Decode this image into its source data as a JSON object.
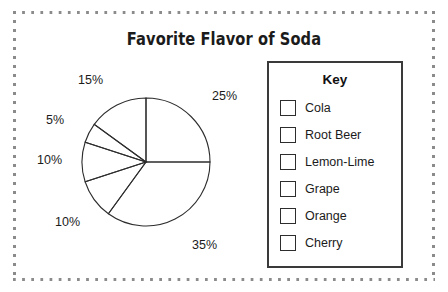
{
  "title": "Favorite Flavor of Soda",
  "key": {
    "heading": "Key",
    "items": [
      {
        "label": "Cola"
      },
      {
        "label": "Root Beer"
      },
      {
        "label": "Lemon-Lime"
      },
      {
        "label": "Grape"
      },
      {
        "label": "Orange"
      },
      {
        "label": "Cherry"
      }
    ]
  },
  "labels": {
    "p25": "25%",
    "p35": "35%",
    "p10a": "10%",
    "p10b": "10%",
    "p5": "5%",
    "p15": "15%"
  },
  "colors": {
    "line": "#2d2d2d",
    "frame_dot": "#8b8b8b",
    "text": "#1b1b1b",
    "slice_fill": "#ffffff"
  },
  "chart_data": {
    "type": "pie",
    "title": "Favorite Flavor of Soda",
    "categories": [
      "Cola",
      "Root Beer",
      "Lemon-Lime",
      "Grape",
      "Orange",
      "Cherry"
    ],
    "values": [
      25,
      35,
      10,
      10,
      5,
      15
    ],
    "value_labels": [
      "25%",
      "35%",
      "10%",
      "10%",
      "5%",
      "15%"
    ],
    "unit": "percent",
    "start_angle_deg": 0,
    "direction": "clockwise",
    "legend_position": "right",
    "legend_title": "Key",
    "slice_fill": "none",
    "grid": false
  }
}
